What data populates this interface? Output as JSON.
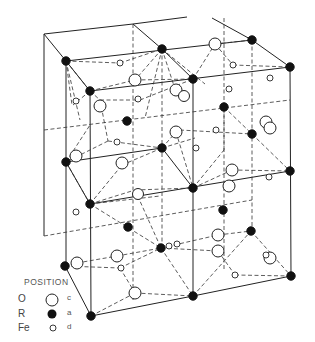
{
  "diagram": {
    "colors": {
      "line": "#222222",
      "filled_atom": "#111111",
      "open_atom_fill": "#ffffff"
    }
  },
  "legend": {
    "title": "POSITION",
    "rows": [
      {
        "element": "O",
        "symbol": "large-open-circle",
        "site": "c"
      },
      {
        "element": "R",
        "symbol": "filled-circle",
        "site": "a"
      },
      {
        "element": "Fe",
        "symbol": "small-open-circle",
        "site": "d"
      }
    ]
  }
}
